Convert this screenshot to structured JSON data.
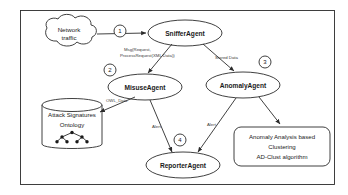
{
  "diagram": {
    "frame": {
      "border_color": "#2b2b2b",
      "background": "#ffffff"
    },
    "nodes": [
      {
        "id": "network-traffic",
        "shape": "cloud",
        "lines": [
          "Network",
          "traffic"
        ]
      },
      {
        "id": "sniffer-agent",
        "shape": "ellipse",
        "lines": [
          "SnifferAgent"
        ]
      },
      {
        "id": "misuse-agent",
        "shape": "ellipse",
        "lines": [
          "MisuseAgent"
        ]
      },
      {
        "id": "anomaly-agent",
        "shape": "ellipse",
        "lines": [
          "AnomalyAgent"
        ]
      },
      {
        "id": "reporter-agent",
        "shape": "ellipse",
        "lines": [
          "ReporterAgent"
        ]
      },
      {
        "id": "attack-signatures-ontology",
        "shape": "cylinder",
        "lines": [
          "Attack Signatures",
          "Ontology"
        ]
      },
      {
        "id": "anomaly-analysis-box",
        "shape": "rounded-rect",
        "lines": [
          "Anomaly Analysis based",
          "Clustering",
          "AD-Clust algorithm"
        ]
      }
    ],
    "edges": [
      {
        "id": "edge-traffic-sniffer",
        "from": "network-traffic",
        "to": "sniffer-agent",
        "label": "",
        "step": "1"
      },
      {
        "id": "edge-sniffer-misuse",
        "from": "sniffer-agent",
        "to": "misuse-agent",
        "label_lines": [
          "Msg(Request,",
          "ProcessRequest(XML Data))"
        ],
        "step": "2"
      },
      {
        "id": "edge-sniffer-anomaly",
        "from": "sniffer-agent",
        "to": "anomaly-agent",
        "label": "Stored Data",
        "step": "3"
      },
      {
        "id": "edge-ontology-misuse",
        "from": "attack-signatures-ontology",
        "to": "misuse-agent",
        "label": "OWL_Data"
      },
      {
        "id": "edge-misuse-reporter",
        "from": "misuse-agent",
        "to": "reporter-agent",
        "label": "Alert",
        "step": "4"
      },
      {
        "id": "edge-anomaly-reporter",
        "from": "anomaly-agent",
        "to": "reporter-agent",
        "label": "Alert"
      },
      {
        "id": "edge-anomaly-analysis",
        "from": "anomaly-agent",
        "to": "anomaly-analysis-box",
        "label": ""
      }
    ],
    "steps": [
      {
        "id": "step-1",
        "number": "1"
      },
      {
        "id": "step-2",
        "number": "2"
      },
      {
        "id": "step-3",
        "number": "3"
      },
      {
        "id": "step-4",
        "number": "4"
      }
    ],
    "node_labels": {
      "network_traffic_line1": "Network",
      "network_traffic_line2": "traffic",
      "sniffer_agent": "SnifferAgent",
      "misuse_agent": "MisuseAgent",
      "anomaly_agent": "AnomalyAgent",
      "reporter_agent": "ReporterAgent",
      "ontology_line1": "Attack Signatures",
      "ontology_line2": "Ontology",
      "analysis_line1": "Anomaly Analysis based",
      "analysis_line2": "Clustering",
      "analysis_line3": "AD-Clust algorithm"
    },
    "edge_labels": {
      "msg_request_line1": "Msg(Request,",
      "msg_request_line2": "ProcessRequest(XML Data))",
      "stored_data": "Stored Data",
      "owl_data": "OWL_Data",
      "alert_left": "Alert",
      "alert_right": "Alert"
    },
    "step_numbers": {
      "one": "1",
      "two": "2",
      "three": "3",
      "four": "4"
    }
  }
}
